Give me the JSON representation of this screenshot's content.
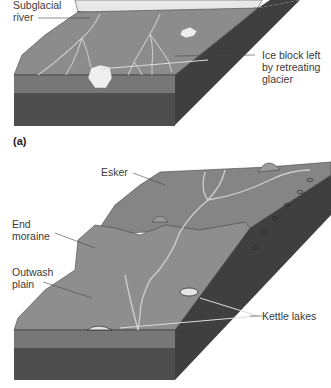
{
  "figure": {
    "panels": [
      {
        "id": "a",
        "letter": "(a)",
        "labels": {
          "subglacial_river_line1": "Subglacial",
          "subglacial_river_line2": "river",
          "ice_block_line1": "Ice block left",
          "ice_block_line2": "by retreating",
          "ice_block_line3": "glacier"
        }
      },
      {
        "id": "b",
        "letter": "(b)",
        "labels": {
          "esker": "Esker",
          "end_moraine_line1": "End",
          "end_moraine_line2": "moraine",
          "outwash_line1": "Outwash",
          "outwash_line2": "plain",
          "kettle_lakes": "Kettle lakes"
        }
      }
    ]
  },
  "colors": {
    "ground_top": "#8a8a8a",
    "ground_side_upper": "#7a7a7a",
    "ground_side_lower": "#4e4e4e",
    "right_face": "#3f3f3f",
    "ice": "#e6e6e6",
    "river": "#c9c9c9",
    "label_text": "#3a3a3a"
  }
}
